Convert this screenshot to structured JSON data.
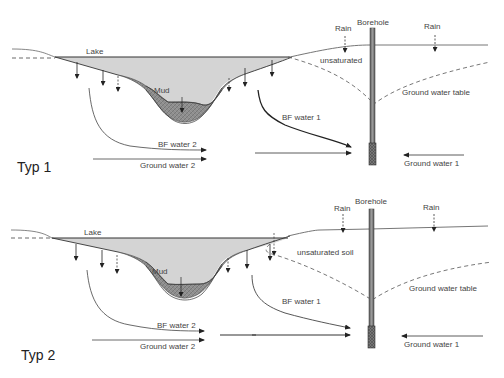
{
  "diagram": {
    "panels": [
      {
        "id": "typ1",
        "title": "Typ 1",
        "labels": {
          "lake": "Lake",
          "mud": "Mud",
          "rain_left": "Rain",
          "rain_right": "Rain",
          "borehole": "Borehole",
          "unsaturated_soil_line1": "unsaturated",
          "unsaturated_soil_line2": "soil",
          "ground_water_table": "Ground water table",
          "bf_water_1": "BF water 1",
          "bf_water_2": "BF water 2",
          "ground_water_2": "Ground water 2",
          "ground_water_1": "Ground water 1"
        }
      },
      {
        "id": "typ2",
        "title": "Typ 2",
        "labels": {
          "lake": "Lake",
          "mud": "Mud",
          "rain_left": "Rain",
          "rain_right": "Rain",
          "borehole": "Borehole",
          "unsaturated_soil": "unsaturated soil",
          "ground_water_table": "Ground water table",
          "bf_water_1": "BF water 1",
          "bf_water_2": "BF water 2",
          "ground_water_2": "Ground water 2",
          "ground_water_1": "Ground water 1"
        }
      }
    ],
    "colors": {
      "lake_fill": "#d4d4d4",
      "mud_fill": "#8a8a8a",
      "line": "#333333",
      "borehole": "#6a6a6a"
    }
  }
}
